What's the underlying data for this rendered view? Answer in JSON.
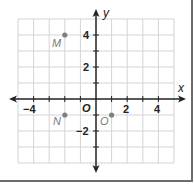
{
  "diagram": {
    "type": "coordinate-plane",
    "axes": {
      "x_label": "x",
      "y_label": "y",
      "origin_label": "O",
      "x_range": [
        -5,
        5
      ],
      "y_range": [
        -4,
        5
      ],
      "x_tick_labels": [
        {
          "value": -4,
          "text": "−4"
        },
        {
          "value": 2,
          "text": "2"
        },
        {
          "value": 4,
          "text": "4"
        }
      ],
      "y_tick_labels": [
        {
          "value": 4,
          "text": "4"
        },
        {
          "value": 2,
          "text": "2"
        },
        {
          "value": -2,
          "text": "−2"
        }
      ]
    },
    "points": [
      {
        "label": "M",
        "x": -2,
        "y": 4
      },
      {
        "label": "N",
        "x": -2,
        "y": -1
      },
      {
        "label": "O",
        "x": 1,
        "y": -1
      }
    ],
    "colors": {
      "grid": "#d4d4d4",
      "axis": "#222222",
      "point": "#808080",
      "point_label": "#7a7a7a",
      "frame": "#6b6b6b"
    }
  }
}
